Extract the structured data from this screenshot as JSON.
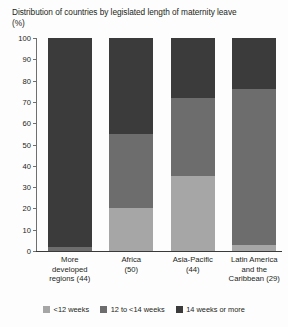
{
  "chart_data": {
    "type": "bar",
    "stacked": true,
    "title": "Distribution of countries by legislated length of maternity leave (%)",
    "xlabel": "",
    "ylabel": "",
    "ylim": [
      0,
      100
    ],
    "yticks": [
      0,
      10,
      20,
      30,
      40,
      50,
      60,
      70,
      80,
      90,
      100
    ],
    "grid": false,
    "legend_position": "bottom",
    "categories": [
      "More developed regions (44)",
      "Africa (50)",
      "Asia-Pacific (44)",
      "Latin America and the Caribbean (29)"
    ],
    "category_lines": [
      [
        "More",
        "developed",
        "regions (44)"
      ],
      [
        "Africa",
        "(50)"
      ],
      [
        "Asia-Pacific",
        "(44)"
      ],
      [
        "Latin America",
        "and the",
        "Caribbean (29)"
      ]
    ],
    "series": [
      {
        "name": "<12 weeks",
        "color": "#a6a6a6",
        "values": [
          0,
          20,
          35,
          3
        ]
      },
      {
        "name": "12 to <14 weeks",
        "color": "#6d6d6d",
        "values": [
          2,
          35,
          37,
          73
        ]
      },
      {
        "name": "14 weeks or more",
        "color": "#3b3b3b",
        "values": [
          98,
          45,
          28,
          24
        ]
      }
    ]
  },
  "legend": {
    "items": [
      {
        "label": "<12 weeks",
        "color": "#a6a6a6"
      },
      {
        "label": "12 to <14 weeks",
        "color": "#6d6d6d"
      },
      {
        "label": "14 weeks or more",
        "color": "#3b3b3b"
      }
    ]
  },
  "axis": {
    "tick_labels": [
      "100",
      "90",
      "80",
      "70",
      "60",
      "50",
      "40",
      "30",
      "20",
      "10",
      "0"
    ]
  }
}
